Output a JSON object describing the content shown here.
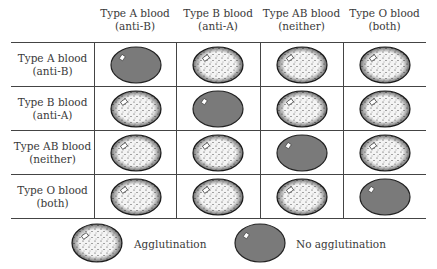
{
  "columns": [
    {
      "label": "Type A blood",
      "sub": "(anti-B)"
    },
    {
      "label": "Type B blood",
      "sub": "(anti-A)"
    },
    {
      "label": "Type AB blood",
      "sub": "(neither)"
    },
    {
      "label": "Type O blood",
      "sub": "(both)"
    }
  ],
  "rows": [
    {
      "label": "Type A blood",
      "sub": "(anti-B)",
      "cells": [
        "none",
        "agg",
        "agg",
        "agg"
      ]
    },
    {
      "label": "Type B blood",
      "sub": "(anti-A)",
      "cells": [
        "agg",
        "none",
        "agg",
        "agg"
      ]
    },
    {
      "label": "Type AB blood",
      "sub": "(neither)",
      "cells": [
        "agg",
        "agg",
        "none",
        "agg"
      ]
    },
    {
      "label": "Type O blood",
      "sub": "(both)",
      "cells": [
        "agg",
        "agg",
        "agg",
        "none"
      ]
    }
  ],
  "legend": {
    "agglutination": "Agglutination",
    "no_agglutination": "No agglutination"
  },
  "colors": {
    "no_agglutination_fill": "#7a7a7a",
    "outline": "#222222",
    "grid": "#444444"
  }
}
